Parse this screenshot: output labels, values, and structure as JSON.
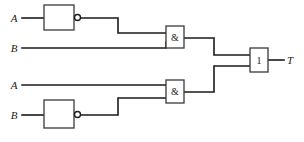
{
  "diagram": {
    "type": "logic-gate-schematic",
    "colors": {
      "background": "#ffffff",
      "wire": "#1a1a1a",
      "gate_outline": "#3a3a3a",
      "text": "#1a1a1a"
    },
    "inputs": [
      {
        "id": "in-a-top",
        "label": "A",
        "x": 14,
        "y": 18
      },
      {
        "id": "in-b-top",
        "label": "B",
        "x": 14,
        "y": 48
      },
      {
        "id": "in-a-bottom",
        "label": "A",
        "x": 14,
        "y": 85
      },
      {
        "id": "in-b-bottom",
        "label": "B",
        "x": 14,
        "y": 115
      }
    ],
    "outputs": [
      {
        "id": "out-t",
        "label": "T",
        "x": 290,
        "y": 60
      }
    ],
    "gates": [
      {
        "id": "not-top",
        "kind": "not",
        "label": "",
        "x": 44,
        "y": 5,
        "w": 30,
        "h": 25,
        "bubble": {
          "cx": 77.5,
          "cy": 17.5,
          "r": 3
        }
      },
      {
        "id": "and-top",
        "kind": "and",
        "label": "&",
        "x": 166,
        "y": 26,
        "w": 18,
        "h": 22,
        "bubble": null
      },
      {
        "id": "and-bottom",
        "kind": "and",
        "label": "&",
        "x": 166,
        "y": 80,
        "w": 18,
        "h": 23,
        "bubble": null
      },
      {
        "id": "not-bottom",
        "kind": "not",
        "label": "",
        "x": 44,
        "y": 100,
        "w": 30,
        "h": 28,
        "bubble": {
          "cx": 77.5,
          "cy": 114.5,
          "r": 3
        }
      },
      {
        "id": "or-out",
        "kind": "or",
        "label": "1",
        "x": 250,
        "y": 48,
        "w": 18,
        "h": 24,
        "bubble": null
      }
    ],
    "wires": [
      {
        "id": "w-a-top-to-not",
        "points": "22,18 44,18"
      },
      {
        "id": "w-not-top-to-and-top",
        "points": "80.5,18 118,18 118,33 166,33"
      },
      {
        "id": "w-b-top-to-and-top",
        "points": "22,48 166,48 166,42"
      },
      {
        "id": "w-a-bottom-to-and-bottom",
        "points": "22,85 166,85"
      },
      {
        "id": "w-b-bottom-to-not",
        "points": "22,115 44,115"
      },
      {
        "id": "w-not-bottom-to-and-bottom",
        "points": "80.5,115 118,115 118,98 166,98"
      },
      {
        "id": "w-and-top-to-or",
        "points": "184,38 214,38 214,55 250,55"
      },
      {
        "id": "w-and-bottom-to-or",
        "points": "184,92 214,92 214,66 250,66"
      },
      {
        "id": "w-or-to-out",
        "points": "268,60 284,60"
      }
    ]
  }
}
